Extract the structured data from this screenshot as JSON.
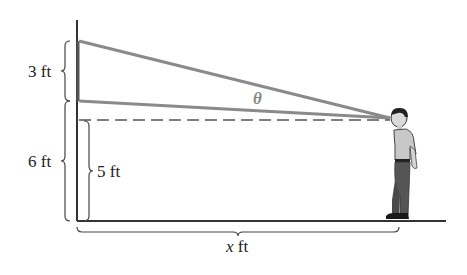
{
  "diagram": {
    "labels": {
      "screen_height": "3 ft",
      "screen_bottom_height": "6 ft",
      "eye_height": "5 ft",
      "distance_var": "x",
      "distance_unit": " ft",
      "angle": "θ"
    },
    "colors": {
      "sight_lines": "#8a8a8a",
      "wall": "#333333",
      "ground": "#333333",
      "dashed": "#555555"
    }
  }
}
